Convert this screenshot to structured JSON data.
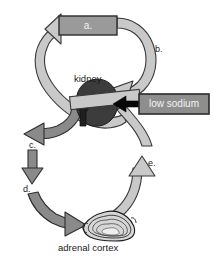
{
  "diagram": {
    "type": "biological-cycle-diagram",
    "background_color": "#ffffff"
  },
  "palette": {
    "light_band": "#c9c9c9",
    "light_band_stroke": "#3a3a3a",
    "dark_band": "#8a8a8a",
    "dark_band_stroke": "#2e2e2e",
    "box_fill": "#9a9a9a",
    "box_stroke": "#2b2b2b",
    "box_text": "#f2f2f2",
    "organ_dark": "#3c3c3c",
    "organ_stroke": "#1c1c1c",
    "black_arrow": "#080808",
    "label_text": "#1a1a1a",
    "cortex_fill": "#d6d6d6",
    "cortex_stroke": "#1e1e1e"
  },
  "boxes": [
    {
      "id": "box-a",
      "label": "a.",
      "x": 59,
      "y": 16,
      "width": 58,
      "height": 19,
      "fill": "#9a9a9a",
      "text_color": "#f0f0f0"
    },
    {
      "id": "box-low-sodium",
      "label": "low sodium",
      "x": 139,
      "y": 94,
      "width": 70,
      "height": 20,
      "fill": "#8e8e8e",
      "text_color": "#f4f4f4"
    }
  ],
  "organ_labels": [
    {
      "id": "kidney-label",
      "text": "kidney",
      "x": 74,
      "y": 74
    },
    {
      "id": "adrenal-cortex-label",
      "text": "adrenal cortex",
      "x": 58,
      "y": 243
    }
  ],
  "step_labels": [
    {
      "id": "label-b",
      "text": "b.",
      "x": 155,
      "y": 45
    },
    {
      "id": "label-c",
      "text": "c.",
      "x": 29,
      "y": 141
    },
    {
      "id": "label-d",
      "text": "d.",
      "x": 23,
      "y": 185
    },
    {
      "id": "label-e",
      "text": "e.",
      "x": 148,
      "y": 159
    }
  ],
  "organs": [
    {
      "id": "kidney",
      "name": "kidney",
      "shape": "bean",
      "fill": "#3c3c3c"
    },
    {
      "id": "adrenal-cortex",
      "name": "adrenal cortex",
      "shape": "layered-triangle-blob",
      "fill": "#d6d6d6"
    }
  ],
  "arrows": [
    {
      "id": "arrow-to-a",
      "from": "kidney",
      "to": "box-a",
      "style": "light-curved",
      "direction": "up-right"
    },
    {
      "id": "arrow-b",
      "from": "box-a",
      "to": "kidney",
      "style": "light-curved",
      "direction": "down-left",
      "label": "b."
    },
    {
      "id": "arrow-c",
      "from": "kidney",
      "to": "step-c",
      "style": "dark-curved",
      "direction": "down-left",
      "label": "c."
    },
    {
      "id": "arrow-c-to-d",
      "from": "step-c",
      "to": "step-d",
      "style": "dark-straight",
      "direction": "down",
      "label": "d."
    },
    {
      "id": "arrow-d",
      "from": "step-d",
      "to": "adrenal-cortex",
      "style": "dark-curved",
      "direction": "down-right"
    },
    {
      "id": "arrow-e",
      "from": "adrenal-cortex",
      "to": "kidney",
      "style": "light-curved",
      "direction": "up",
      "label": "e."
    },
    {
      "id": "arrow-low-sodium",
      "from": "box-low-sodium",
      "to": "kidney",
      "style": "black-straight",
      "direction": "left"
    }
  ]
}
